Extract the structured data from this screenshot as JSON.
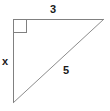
{
  "figure": {
    "name": "right-triangle-diagram",
    "canvas": {
      "width": 110,
      "height": 111
    },
    "background_color": "#ffffff",
    "stroke_color": "#808080",
    "label_color": "#1a1a1a",
    "stroke_width": 1,
    "vertices": {
      "top_left": {
        "x": 13,
        "y": 19
      },
      "top_right": {
        "x": 104,
        "y": 19
      },
      "bottom_left": {
        "x": 13,
        "y": 103
      }
    },
    "right_angle_marker": {
      "at_vertex": "top_left",
      "x": 13,
      "y": 19,
      "size": 13
    },
    "labels": {
      "top_leg": "3",
      "left_leg": "x",
      "hypotenuse": "5"
    }
  }
}
